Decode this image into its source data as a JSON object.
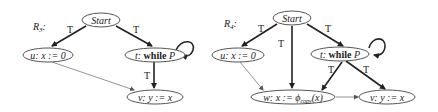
{
  "diagrams": [
    {
      "title": "R",
      "title_sub": "3",
      "nodes": {
        "start": {
          "label": "Start"
        },
        "u": {
          "id": "u:",
          "stmt": "x := 0"
        },
        "t": {
          "id": "t:",
          "kw": "while",
          "var": "P"
        },
        "v": {
          "id": "v:",
          "stmt": "y := x"
        }
      },
      "edges": [
        {
          "from": "start",
          "to": "u",
          "label": "T"
        },
        {
          "from": "start",
          "to": "t",
          "label": "T"
        },
        {
          "from": "t",
          "to": "v",
          "label": "T"
        },
        {
          "from": "u",
          "to": "v",
          "label": ""
        },
        {
          "from": "t",
          "to": "t",
          "label": ""
        }
      ]
    },
    {
      "title": "R",
      "title_sub": "4",
      "nodes": {
        "start": {
          "label": "Start"
        },
        "u": {
          "id": "u:",
          "stmt": "x := 0"
        },
        "t": {
          "id": "t:",
          "kw": "while",
          "var": "P"
        },
        "w": {
          "id": "w:",
          "stmt_pre": "x := ϕ",
          "stmt_sub": "copy",
          "stmt_post": "(x)"
        },
        "v": {
          "id": "v:",
          "stmt": "y := x"
        }
      },
      "edges": [
        {
          "from": "start",
          "to": "u",
          "label": "T"
        },
        {
          "from": "start",
          "to": "w",
          "label": "T"
        },
        {
          "from": "start",
          "to": "t",
          "label": "T"
        },
        {
          "from": "t",
          "to": "w",
          "label": "T"
        },
        {
          "from": "t",
          "to": "v",
          "label": "T"
        },
        {
          "from": "u",
          "to": "w",
          "label": ""
        },
        {
          "from": "w",
          "to": "v",
          "label": ""
        },
        {
          "from": "t",
          "to": "t",
          "label": ""
        }
      ]
    }
  ]
}
